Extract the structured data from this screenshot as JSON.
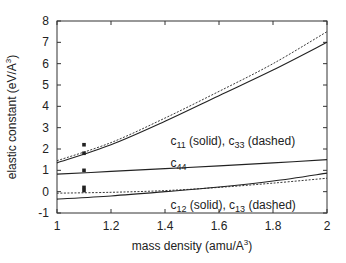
{
  "chart_data": {
    "type": "line",
    "title": "",
    "xlabel": "mass density (amu/A^3)",
    "xlabel_parts": {
      "main": "mass density (amu/A",
      "sup": "3",
      "end": ")"
    },
    "ylabel": "elastic constant (eV/A^3)",
    "ylabel_parts": {
      "main": "elastic constant (eV/A",
      "sup": "3",
      "end": ")"
    },
    "xlim": [
      1,
      2
    ],
    "ylim": [
      -1,
      8
    ],
    "xticks": [
      1,
      1.2,
      1.4,
      1.6,
      1.8,
      2
    ],
    "xtick_labels": [
      "1",
      "1.2",
      "1.4",
      "1.6",
      "1.8",
      "2"
    ],
    "yticks": [
      -1,
      0,
      1,
      2,
      3,
      4,
      5,
      6,
      7,
      8
    ],
    "ytick_labels": [
      "-1",
      "0",
      "1",
      "2",
      "3",
      "4",
      "5",
      "6",
      "7",
      "8"
    ],
    "grid": false,
    "legend": "none (inline annotations)",
    "x": [
      1.0,
      1.2,
      1.4,
      1.6,
      1.8,
      2.0
    ],
    "series": [
      {
        "name": "c11",
        "style": "solid",
        "values": [
          1.35,
          2.2,
          3.3,
          4.5,
          5.7,
          7.0
        ]
      },
      {
        "name": "c33",
        "style": "dashed",
        "values": [
          1.45,
          2.3,
          3.45,
          4.7,
          6.0,
          7.5
        ]
      },
      {
        "name": "c44",
        "style": "solid",
        "values": [
          0.82,
          0.95,
          1.08,
          1.21,
          1.35,
          1.5
        ]
      },
      {
        "name": "c12",
        "style": "solid",
        "values": [
          -0.35,
          -0.2,
          0.0,
          0.22,
          0.5,
          0.87
        ]
      },
      {
        "name": "c13",
        "style": "dashed",
        "values": [
          -0.07,
          -0.03,
          0.05,
          0.2,
          0.4,
          0.63
        ]
      }
    ],
    "points": [
      {
        "x": 1.1,
        "y": 2.2,
        "label": "c33 point"
      },
      {
        "x": 1.1,
        "y": 1.8,
        "label": "c11 point"
      },
      {
        "x": 1.1,
        "y": 1.0,
        "label": "c44 point"
      },
      {
        "x": 1.1,
        "y": 0.2,
        "label": "c12/c13 point"
      },
      {
        "x": 1.1,
        "y": 0.05,
        "label": "c12/c13 point"
      }
    ],
    "annotations": [
      {
        "text_parts": [
          [
            "c",
            "11",
            " (solid), "
          ],
          [
            "c",
            "33",
            " (dashed)"
          ]
        ],
        "x": 1.42,
        "y": 2.2
      },
      {
        "text_parts": [
          [
            "c",
            "44",
            ""
          ]
        ],
        "x": 1.42,
        "y": 1.15
      },
      {
        "text_parts": [
          [
            "c",
            "12",
            " (solid), "
          ],
          [
            "c",
            "13",
            " (dashed)"
          ]
        ],
        "x": 1.42,
        "y": -0.8
      }
    ]
  }
}
